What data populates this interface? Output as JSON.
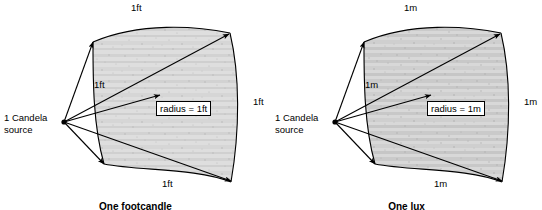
{
  "figure": {
    "background_color": "#ffffff",
    "line_color": "#000000",
    "patch_fill_color": "#d9d9d9"
  },
  "panels": [
    {
      "id": "footcandle",
      "source_label": "1 Candela\nsource",
      "radius_label": "radius = 1ft",
      "edge_labels": {
        "top": "1ft",
        "right": "1ft",
        "bottom": "1ft",
        "inner_left": "1ft"
      },
      "caption": "One footcandle"
    },
    {
      "id": "lux",
      "source_label": "1 Candela\nsource",
      "radius_label": "radius = 1m",
      "edge_labels": {
        "top": "1m",
        "right": "1m",
        "bottom": "1m",
        "inner_left": "1m"
      },
      "caption": "One lux"
    }
  ]
}
